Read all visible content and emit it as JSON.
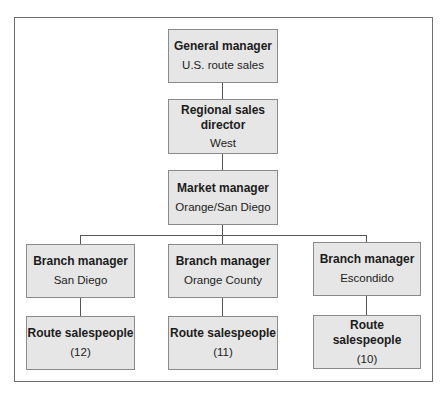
{
  "chart": {
    "type": "org-chart",
    "nodes": [
      {
        "id": "gm",
        "title": "General manager",
        "subtitle": "U.S. route sales"
      },
      {
        "id": "rsd",
        "title": "Regional sales director",
        "subtitle": "West"
      },
      {
        "id": "mm",
        "title": "Market manager",
        "subtitle": "Orange/San Diego"
      },
      {
        "id": "bm_sd",
        "title": "Branch manager",
        "subtitle": "San Diego"
      },
      {
        "id": "bm_oc",
        "title": "Branch manager",
        "subtitle": "Orange County"
      },
      {
        "id": "bm_es",
        "title": "Branch manager",
        "subtitle": "Escondido"
      },
      {
        "id": "rs_sd",
        "title": "Route salespeople",
        "subtitle": "(12)"
      },
      {
        "id": "rs_oc",
        "title": "Route salespeople",
        "subtitle": "(11)"
      },
      {
        "id": "rs_es",
        "title": "Route salespeople",
        "subtitle": "(10)"
      }
    ],
    "edges": [
      [
        "gm",
        "rsd"
      ],
      [
        "rsd",
        "mm"
      ],
      [
        "mm",
        "bm_sd"
      ],
      [
        "mm",
        "bm_oc"
      ],
      [
        "mm",
        "bm_es"
      ],
      [
        "bm_sd",
        "rs_sd"
      ],
      [
        "bm_oc",
        "rs_oc"
      ],
      [
        "bm_es",
        "rs_es"
      ]
    ]
  },
  "boxes": {
    "gm": {
      "title": "General manager",
      "subtitle": "U.S. route sales"
    },
    "rsd": {
      "title_line1": "Regional sales",
      "title_line2": "director",
      "subtitle": "West"
    },
    "mm": {
      "title": "Market manager",
      "subtitle": "Orange/San Diego"
    },
    "bm_sd": {
      "title": "Branch manager",
      "subtitle": "San Diego"
    },
    "bm_oc": {
      "title": "Branch manager",
      "subtitle": "Orange County"
    },
    "bm_es": {
      "title": "Branch manager",
      "subtitle": "Escondido"
    },
    "rs_sd": {
      "title": "Route salespeople",
      "subtitle": "(12)"
    },
    "rs_oc": {
      "title": "Route salespeople",
      "subtitle": "(11)"
    },
    "rs_es": {
      "title": "Route salespeople",
      "subtitle": "(10)"
    }
  },
  "colors": {
    "box_fill": "#e6e6e6",
    "box_border": "#8a8a8a",
    "line": "#555555",
    "frame": "#6e6e6e"
  }
}
